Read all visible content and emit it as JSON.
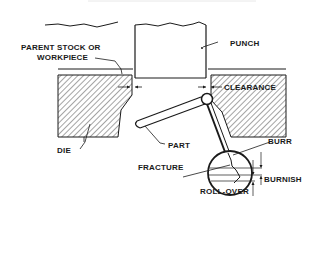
{
  "diagram": {
    "type": "punching-process-cross-section",
    "labels": {
      "parent_stock_line1": "PARENT STOCK OR",
      "parent_stock_line2": "WORKPIECE",
      "punch": "PUNCH",
      "clearance": "CLEARANCE",
      "part": "PART",
      "die": "DIE",
      "burr": "BURR",
      "fracture": "FRACTURE",
      "burnish": "BURNISH",
      "roll_over": "ROLL-OVER"
    },
    "colors": {
      "ink": "#1a1a1a",
      "background": "#ffffff"
    }
  }
}
